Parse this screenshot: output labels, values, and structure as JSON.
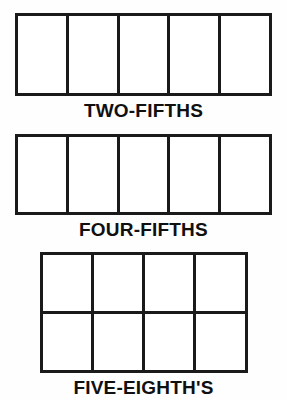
{
  "page": {
    "background_color": "#fefefe",
    "line_color": "#1a1a1a",
    "text_color": "#101010"
  },
  "figures": [
    {
      "id": "figure-two-fifths",
      "caption": "TWO-FIFTHS",
      "columns": 5,
      "rows": 1,
      "total_cells": 5,
      "shaded_cells": 0,
      "fraction_numerator": 2,
      "fraction_denominator": 5
    },
    {
      "id": "figure-four-fifths",
      "caption": "FOUR-FIFTHS",
      "columns": 5,
      "rows": 1,
      "total_cells": 5,
      "shaded_cells": 0,
      "fraction_numerator": 4,
      "fraction_denominator": 5
    },
    {
      "id": "figure-five-eighths",
      "caption": "FIVE-EIGHTH'S",
      "columns": 4,
      "rows": 2,
      "total_cells": 8,
      "shaded_cells": 0,
      "fraction_numerator": 5,
      "fraction_denominator": 8
    }
  ]
}
